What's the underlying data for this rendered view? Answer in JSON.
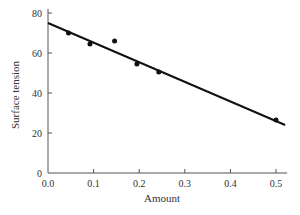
{
  "chart_data": {
    "type": "scatter",
    "title": "",
    "xlabel": "Amount",
    "ylabel": "Surface tension",
    "xlim": [
      0.0,
      0.52
    ],
    "ylim": [
      0,
      80
    ],
    "xticks": [
      "0.0",
      "0.1",
      "0.2",
      "0.3",
      "0.4",
      "0.5"
    ],
    "yticks": [
      "0",
      "20",
      "40",
      "60",
      "80"
    ],
    "grid": false,
    "legend": null,
    "series": [
      {
        "name": "observations",
        "type": "scatter",
        "x": [
          0.045,
          0.092,
          0.146,
          0.195,
          0.243,
          0.5
        ],
        "y": [
          70,
          64.5,
          66,
          54.5,
          50.5,
          26.5
        ]
      },
      {
        "name": "fitted line",
        "type": "line",
        "x": [
          0.0,
          0.52
        ],
        "y": [
          75,
          24
        ]
      }
    ]
  },
  "colors": {
    "axis": "#555555",
    "points": "#111111",
    "line": "#111111",
    "text": "#333333"
  }
}
